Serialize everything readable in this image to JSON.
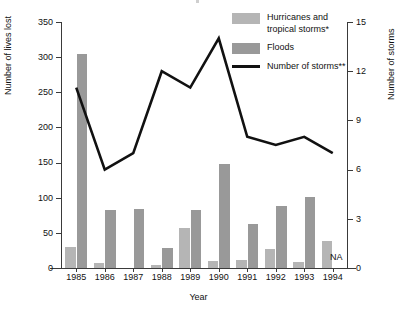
{
  "axes": {
    "y_left_title": "Number of lives lost",
    "y_right_title": "Number of storms",
    "x_title": "Year",
    "y_left_ticks": [
      "350",
      "300",
      "250",
      "200",
      "150",
      "100",
      "50",
      "0"
    ],
    "y_right_ticks": [
      "15",
      "12",
      "9",
      "6",
      "3",
      "0"
    ],
    "x_ticks": [
      "1985",
      "1986",
      "1987",
      "1988",
      "1989",
      "1990",
      "1991",
      "1992",
      "1993",
      "1994"
    ]
  },
  "legend": {
    "items": [
      {
        "label": "Hurricanes and tropical storms*",
        "marker": "swatch",
        "color": "#b5b5b5"
      },
      {
        "label": "Floods",
        "marker": "swatch",
        "color": "#999999"
      },
      {
        "label": "Number of storms**",
        "marker": "line",
        "color": "#111111"
      }
    ]
  },
  "annotations": {
    "na_label": "NA"
  },
  "chart_data": {
    "type": "bar",
    "title": "",
    "xlabel": "Year",
    "ylabel": "Number of lives lost",
    "y2label": "Number of storms",
    "categories": [
      "1985",
      "1986",
      "1987",
      "1988",
      "1989",
      "1990",
      "1991",
      "1992",
      "1993",
      "1994"
    ],
    "ylim": [
      0,
      350
    ],
    "y2lim": [
      0,
      15
    ],
    "grid": false,
    "legend_position": "top-right",
    "series": [
      {
        "name": "Hurricanes and tropical storms*",
        "type": "bar",
        "axis": "left",
        "color": "#b5b5b5",
        "values": [
          30,
          7,
          0,
          5,
          57,
          10,
          11,
          27,
          8,
          38
        ]
      },
      {
        "name": "Floods",
        "type": "bar",
        "axis": "left",
        "color": "#999999",
        "values": [
          305,
          82,
          84,
          29,
          82,
          148,
          63,
          88,
          101,
          null
        ]
      },
      {
        "name": "Number of storms**",
        "type": "line",
        "axis": "right",
        "color": "#111111",
        "values": [
          11,
          6,
          7,
          12,
          11,
          14,
          8,
          7.5,
          8,
          7
        ]
      }
    ]
  }
}
